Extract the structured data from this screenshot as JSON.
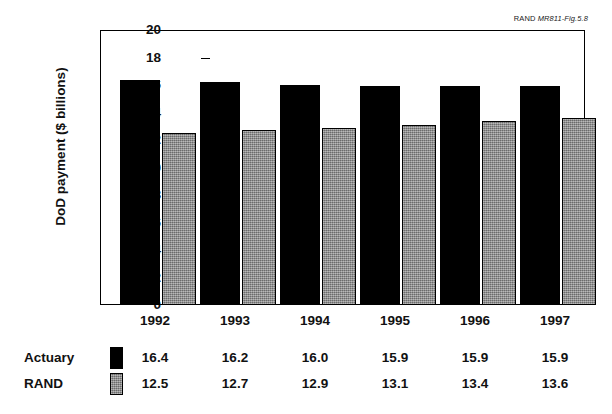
{
  "source_credit": {
    "prefix": "RAND ",
    "ref": "MR811-Fig.5.8"
  },
  "chart_data": {
    "type": "bar",
    "title": "",
    "xlabel": "",
    "ylabel": "DoD payment ($ billions)",
    "categories": [
      "1992",
      "1993",
      "1994",
      "1995",
      "1996",
      "1997"
    ],
    "series": [
      {
        "name": "Actuary",
        "values": [
          16.4,
          16.2,
          16.0,
          15.9,
          15.9,
          15.9
        ],
        "color": "#000000"
      },
      {
        "name": "RAND",
        "values": [
          12.5,
          12.7,
          12.9,
          13.1,
          13.4,
          13.6
        ],
        "color": "#8e8e8e"
      }
    ],
    "ylim": [
      0,
      20
    ],
    "yticks": [
      0,
      2,
      4,
      6,
      8,
      10,
      12,
      14,
      16,
      18,
      20
    ],
    "ytick_labels": [
      "0",
      "2",
      "4",
      "6",
      "8",
      "10",
      "12",
      "14",
      "16",
      "18",
      "20"
    ],
    "grid": false,
    "legend_position": "below-left",
    "data_table": {
      "header": [
        "",
        "",
        "1992",
        "1993",
        "1994",
        "1995",
        "1996",
        "1997"
      ],
      "rows": [
        {
          "label": "Actuary",
          "swatch": "black",
          "values": [
            "16.4",
            "16.2",
            "16.0",
            "15.9",
            "15.9",
            "15.9"
          ]
        },
        {
          "label": "RAND",
          "swatch": "gray",
          "values": [
            "12.5",
            "12.7",
            "12.9",
            "13.1",
            "13.4",
            "13.6"
          ]
        }
      ]
    }
  }
}
